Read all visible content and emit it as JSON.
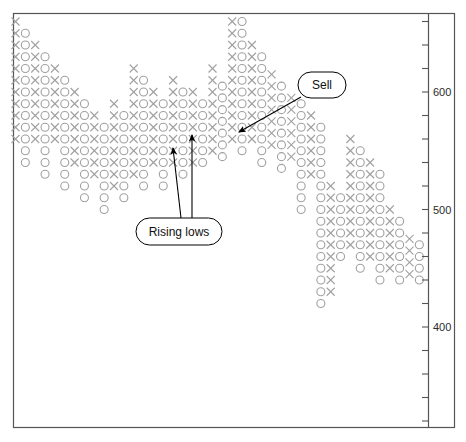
{
  "chart_data": {
    "type": "scatter",
    "chart_kind": "point-and-figure",
    "title": "",
    "xlabel": "",
    "ylabel": "",
    "ylim": [
      330,
      680
    ],
    "y_ticks_labeled": [
      600,
      500,
      400
    ],
    "y_tick_step": 20,
    "box_size": 10,
    "grid": false,
    "legend": null,
    "marker_x": "X",
    "marker_o": "O",
    "marker_color": "#a0a0a0",
    "axis_position": "right",
    "columns": [
      {
        "type": "X",
        "top": 660,
        "bottom": 560
      },
      {
        "type": "O",
        "top": 650,
        "bottom": 540
      },
      {
        "type": "X",
        "top": 640,
        "bottom": 560
      },
      {
        "type": "O",
        "top": 630,
        "bottom": 530
      },
      {
        "type": "X",
        "top": 620,
        "bottom": 560
      },
      {
        "type": "O",
        "top": 610,
        "bottom": 520
      },
      {
        "type": "X",
        "top": 600,
        "bottom": 540
      },
      {
        "type": "O",
        "top": 590,
        "bottom": 510
      },
      {
        "type": "X",
        "top": 580,
        "bottom": 530
      },
      {
        "type": "O",
        "top": 570,
        "bottom": 500
      },
      {
        "type": "X",
        "top": 590,
        "bottom": 520
      },
      {
        "type": "O",
        "top": 580,
        "bottom": 510
      },
      {
        "type": "X",
        "top": 620,
        "bottom": 530
      },
      {
        "type": "O",
        "top": 610,
        "bottom": 520
      },
      {
        "type": "X",
        "top": 600,
        "bottom": 540
      },
      {
        "type": "O",
        "top": 590,
        "bottom": 520
      },
      {
        "type": "X",
        "top": 610,
        "bottom": 540
      },
      {
        "type": "O",
        "top": 600,
        "bottom": 530
      },
      {
        "type": "X",
        "top": 600,
        "bottom": 540
      },
      {
        "type": "O",
        "top": 590,
        "bottom": 540
      },
      {
        "type": "X",
        "top": 620,
        "bottom": 550
      },
      {
        "type": "O",
        "top": 610,
        "bottom": 545
      },
      {
        "type": "X",
        "top": 670,
        "bottom": 560
      },
      {
        "type": "O",
        "top": 660,
        "bottom": 550
      },
      {
        "type": "X",
        "top": 640,
        "bottom": 560
      },
      {
        "type": "O",
        "top": 630,
        "bottom": 540
      },
      {
        "type": "X",
        "top": 620,
        "bottom": 555
      },
      {
        "type": "O",
        "top": 610,
        "bottom": 535
      },
      {
        "type": "X",
        "top": 600,
        "bottom": 545
      },
      {
        "type": "O",
        "top": 590,
        "bottom": 500
      },
      {
        "type": "X",
        "top": 580,
        "bottom": 530
      },
      {
        "type": "O",
        "top": 570,
        "bottom": 420
      },
      {
        "type": "X",
        "top": 520,
        "bottom": 430
      },
      {
        "type": "O",
        "top": 510,
        "bottom": 460
      },
      {
        "type": "X",
        "top": 560,
        "bottom": 470
      },
      {
        "type": "O",
        "top": 550,
        "bottom": 450
      },
      {
        "type": "X",
        "top": 540,
        "bottom": 460
      },
      {
        "type": "O",
        "top": 530,
        "bottom": 440
      },
      {
        "type": "X",
        "top": 500,
        "bottom": 450
      },
      {
        "type": "O",
        "top": 490,
        "bottom": 440
      },
      {
        "type": "X",
        "top": 480,
        "bottom": 445
      },
      {
        "type": "O",
        "top": 475,
        "bottom": 440
      }
    ],
    "annotations": [
      {
        "id": "rising-lows",
        "label": "Rising lows",
        "box": {
          "x": 136,
          "y": 218,
          "w": 86,
          "h": 27
        },
        "arrows": [
          {
            "x1": 181,
            "y1": 218,
            "x2": 173,
            "y2": 148
          },
          {
            "x1": 192,
            "y1": 218,
            "x2": 192,
            "y2": 135
          }
        ]
      },
      {
        "id": "sell",
        "label": "Sell",
        "box": {
          "x": 298,
          "y": 72,
          "w": 48,
          "h": 26
        },
        "arrows": [
          {
            "x1": 301,
            "y1": 97,
            "x2": 239,
            "y2": 132
          }
        ]
      }
    ]
  },
  "axis": {
    "tick_labels": [
      "600",
      "500",
      "400"
    ]
  }
}
